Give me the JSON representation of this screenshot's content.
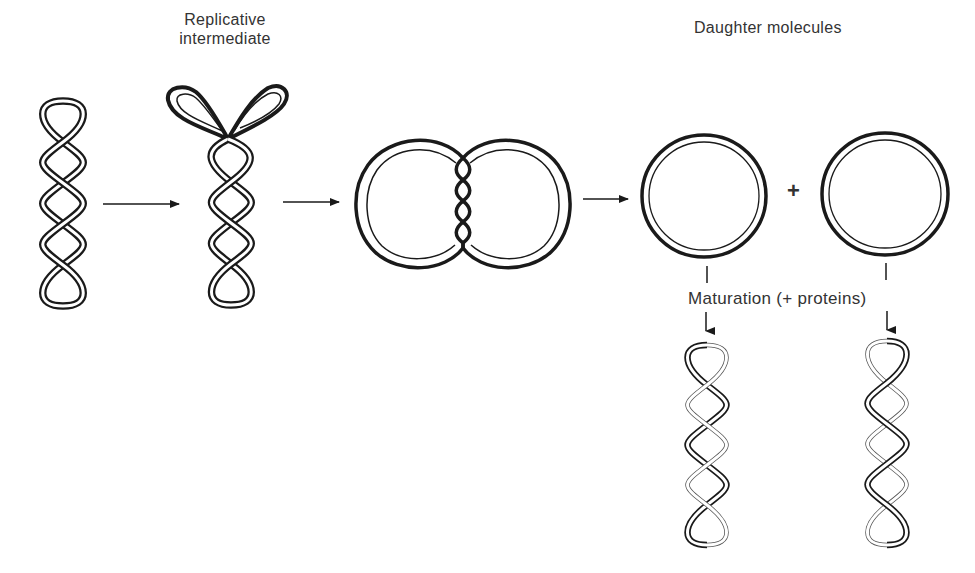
{
  "figure": {
    "labels": {
      "replicative_line1": "Replicative",
      "replicative_line2": "intermediate",
      "daughter_molecules": "Daughter molecules",
      "maturation": "Maturation (+ proteins)",
      "plus": "+"
    },
    "stages": [
      {
        "id": "parental-supercoiled-dna",
        "description": "Supercoiled parental duplex (two strands, 5 twists)"
      },
      {
        "id": "replicative-intermediate",
        "description": "Supercoiled duplex with two replication loops at top"
      },
      {
        "id": "catenated-dimer",
        "description": "Two interlinked circles joined by short intertwined region"
      },
      {
        "id": "daughter-circles",
        "description": "Two relaxed daughter circles (old strand thick, new strand thin)"
      },
      {
        "id": "mature-daughters",
        "description": "Supercoiled daughter molecules after maturation"
      }
    ],
    "colors": {
      "background": "#ffffff",
      "ink": "#1a1a1a",
      "text": "#333333"
    }
  }
}
